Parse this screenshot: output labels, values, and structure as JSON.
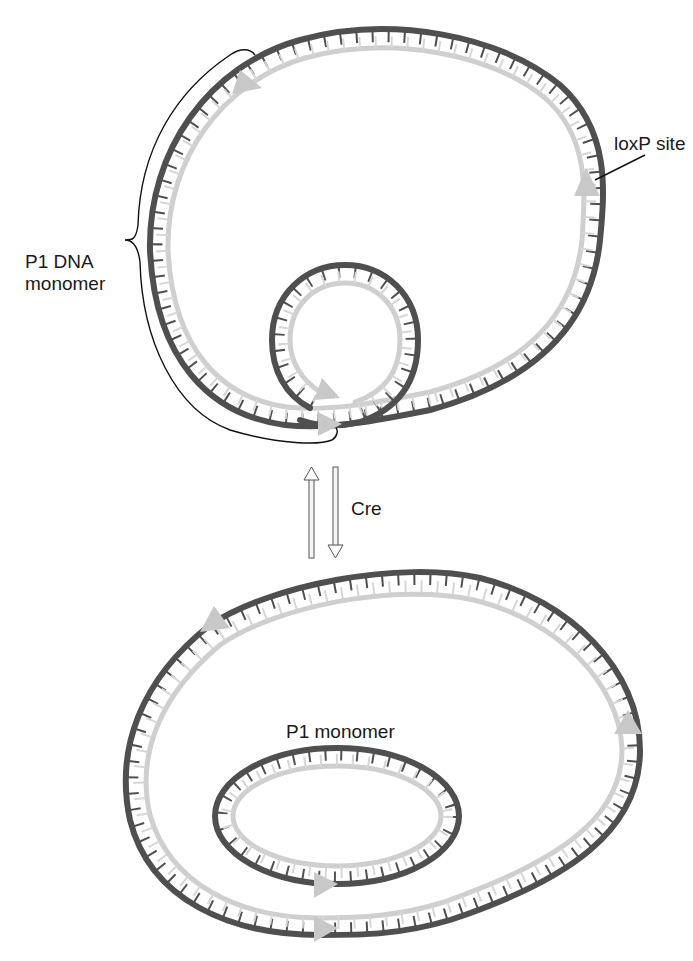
{
  "figure": {
    "colors": {
      "dark_strand": "#4f4f4f",
      "light_strand": "#cfcfcf",
      "loxp_arrowhead": "#c8c8c8",
      "text": "#1a1a1a"
    }
  },
  "top_diagram": {
    "labels": {
      "loxp_site": "loxP site",
      "p1_dna_monomer_line1": "P1 DNA",
      "p1_dna_monomer_line2": "monomer"
    }
  },
  "reaction": {
    "enzyme_label": "Cre",
    "direction": "reversible"
  },
  "bottom_diagram": {
    "labels": {
      "p1_monomer": "P1 monomer"
    }
  }
}
